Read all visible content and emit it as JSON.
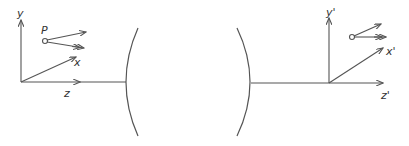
{
  "diagram": {
    "type": "optical-lens-coordinate-transform",
    "colors": {
      "stroke": "#555555",
      "text": "#333333",
      "background": "#ffffff"
    },
    "object_frame": {
      "labels": {
        "y": "y",
        "x": "x",
        "z": "z",
        "point": "P"
      }
    },
    "image_frame": {
      "labels": {
        "y": "y'",
        "x": "x'",
        "z": "z'"
      }
    },
    "lens": {
      "surfaces": 2,
      "shape": "biconcave-arcs"
    }
  }
}
